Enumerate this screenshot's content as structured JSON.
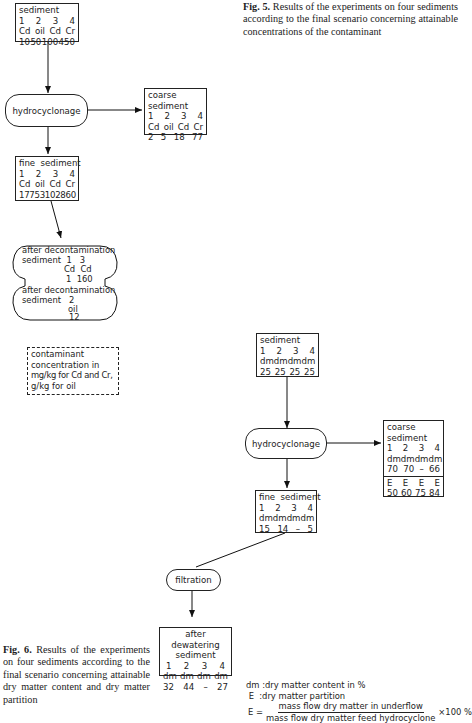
{
  "fig5": {
    "caption_label": "Fig. 5.",
    "caption_text": "Results of the experiments on four sediments according to the final scenario concerning attainable concentrations of the contaminant",
    "sediment": {
      "title": "sediment",
      "numbers": [
        "1",
        "2",
        "3",
        "4"
      ],
      "units": [
        "Cd",
        "oil",
        "Cd",
        "Cr"
      ],
      "values": [
        "10",
        "50",
        "100",
        "450"
      ]
    },
    "process": "hydrocyclonage",
    "coarse": {
      "title_line1": "coarse",
      "title_line2": "sediment",
      "numbers": [
        "1",
        "2",
        "3",
        "4"
      ],
      "units": [
        "Cd",
        "oil",
        "Cd",
        "Cr"
      ],
      "values": [
        "2",
        "5",
        "18",
        "77"
      ]
    },
    "fine": {
      "title": "fine  sediment",
      "numbers": [
        "1",
        "2",
        "3",
        "4"
      ],
      "units": [
        "Cd",
        "oil",
        "Cd",
        "Cr"
      ],
      "values": [
        "17",
        "75",
        "310",
        "2860"
      ]
    },
    "decon_top": {
      "title": "after decontamination",
      "label": "sediment",
      "numbers": "1   3",
      "units": "Cd  Cd",
      "values": "1  160"
    },
    "decon_bottom": {
      "title": "after decontamination",
      "label": "sediment",
      "number": "2",
      "unit": "oil",
      "value": "12"
    },
    "note": {
      "line1": "contaminant",
      "line2": "concentration in",
      "line3": "mg/kg for Cd  and Cr,",
      "line4": "g/kg for oil"
    }
  },
  "fig6": {
    "caption_label": "Fig. 6.",
    "caption_text": "Results of the experiments on four sediments according to the final scenario concerning attainable dry matter content and dry matter partition",
    "sediment": {
      "title": "sediment",
      "numbers": [
        "1",
        "2",
        "3",
        "4"
      ],
      "units": [
        "dm",
        "dm",
        "dm",
        "dm"
      ],
      "values": [
        "25",
        "25",
        "25",
        "25"
      ]
    },
    "process": "hydrocyclonage",
    "coarse": {
      "title_line1": "coarse",
      "title_line2": "sediment",
      "numbers": [
        "1",
        "2",
        "3",
        "4"
      ],
      "units": [
        "dm",
        "dm",
        "dm",
        "dm"
      ],
      "values": [
        "70",
        "70",
        "–",
        "66"
      ],
      "e_labels": [
        "E",
        "E",
        "E",
        "E"
      ],
      "e_values": [
        "50",
        "60",
        "75",
        "84"
      ]
    },
    "fine": {
      "title": "fine  sediment",
      "numbers": [
        "1",
        "2",
        "3",
        "4"
      ],
      "units": [
        "dm",
        "dm",
        "dm",
        "dm"
      ],
      "values": [
        "15",
        "14",
        "–",
        "5"
      ]
    },
    "filtration": "filtration",
    "dewatered": {
      "title_line1": "after dewatering",
      "title_line2": "sediment",
      "numbers": [
        "1",
        "2",
        "3",
        "4"
      ],
      "units": [
        "dm",
        "dm",
        "dm",
        "dm"
      ],
      "values": [
        "32",
        "44",
        "–",
        "27"
      ]
    },
    "legend": {
      "dm_line": "dm :dry matter content in %",
      "e_line": " E  :dry matter partition",
      "formula_lhs": "E =",
      "numerator": "mass flow dry matter in underflow",
      "denominator": "mass flow dry matter feed hydrocyclone",
      "multiplier": "×100 %"
    }
  }
}
